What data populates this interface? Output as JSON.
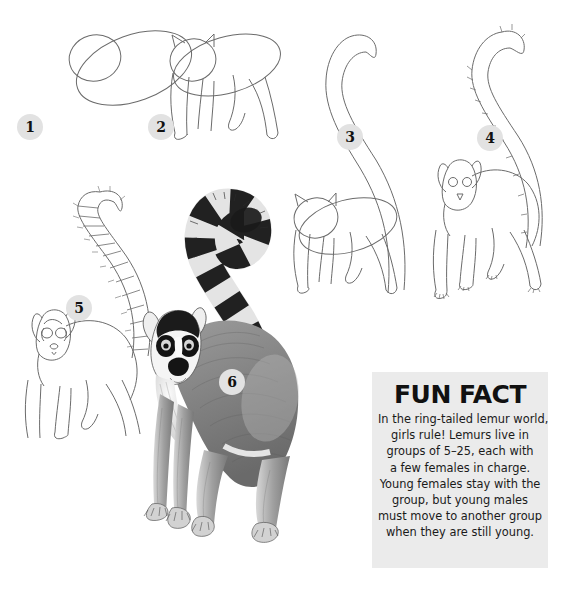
{
  "page": {
    "background_color": "#ffffff",
    "line_color": "#6b6b6b",
    "badge_color": "#e2e2e2",
    "badge_text_color": "#111111"
  },
  "steps": [
    {
      "number": "1",
      "caption": "Two overlapping ovals: large tilted body oval and smaller head circle"
    },
    {
      "number": "2",
      "caption": "Add pointed ears and four tapering legs"
    },
    {
      "number": "3",
      "caption": "Add the long S-curved tail sweeping up from the hindquarters"
    },
    {
      "number": "4",
      "caption": "Refine the outline; add eyes, nose, hands and feet"
    },
    {
      "number": "5",
      "caption": "Divide the tail into ring bands and add facial markings"
    },
    {
      "number": "6",
      "caption": "Shade the fur and fill the tail rings black and white"
    }
  ],
  "fun_fact": {
    "title": "FUN FACT",
    "lines": [
      "In the ring-tailed lemur world,",
      "girls rule! Lemurs live in",
      "groups of 5–25, each with",
      "a few females in charge.",
      "Young females stay with the",
      "group, but young males",
      "must move to another group",
      "when they are still young."
    ],
    "background_color": "#ebebeb"
  }
}
